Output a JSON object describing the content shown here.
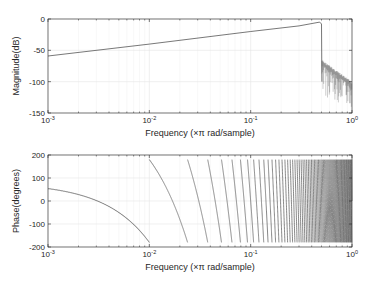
{
  "chart_data": [
    {
      "type": "line",
      "title": "",
      "xlabel": "Frequency (×π rad/sample)",
      "ylabel": "Magnitude(dB)",
      "xscale": "log",
      "xlim": [
        0.001,
        1
      ],
      "ylim": [
        -150,
        0
      ],
      "xticks": [
        0.001,
        0.01,
        0.1,
        1
      ],
      "xtick_labels": [
        "10^-3",
        "10^-2",
        "10^-1",
        "10^0"
      ],
      "yticks": [
        -150,
        -100,
        -50,
        0
      ],
      "ytick_labels": [
        "-150",
        "-100",
        "-50",
        "0"
      ],
      "grid": true,
      "series": [
        {
          "name": "magnitude",
          "x": [
            0.001,
            0.01,
            0.1,
            0.3,
            0.48,
            0.5,
            0.505
          ],
          "values": [
            -59,
            -40,
            -20,
            -11,
            -5,
            -8,
            -100
          ],
          "stopband": {
            "x_range": [
              0.505,
              1.0
            ],
            "upper_envelope_db": [
              -65,
              -100
            ],
            "lower_envelope_db": [
              -115,
              -135
            ]
          }
        }
      ]
    },
    {
      "type": "line",
      "title": "",
      "xlabel": "Frequency (×π rad/sample)",
      "ylabel": "Phase(degrees)",
      "xscale": "log",
      "xlim": [
        0.001,
        1
      ],
      "ylim": [
        -200,
        200
      ],
      "xticks": [
        0.001,
        0.01,
        0.1,
        1
      ],
      "xtick_labels": [
        "10^-3",
        "10^-2",
        "10^-1",
        "10^0"
      ],
      "yticks": [
        -200,
        -100,
        0,
        100,
        200
      ],
      "ytick_labels": [
        "-200",
        "-100",
        "0",
        "100",
        "200"
      ],
      "grid": true,
      "series": [
        {
          "name": "phase",
          "description": "linear phase wrapped to [-180,180]",
          "start_deg": 80,
          "slope_deg_per_unit": -26000,
          "first_wrap_x": 0.0227,
          "values_at": {
            "0.001": 76,
            "0.01": -20,
            "0.0227": -180
          }
        }
      ]
    }
  ],
  "figure": {
    "background": "#ffffff",
    "axes_color": "#262626",
    "line_color": "#4d4d4d",
    "grid_color": "#e6e6e6"
  }
}
